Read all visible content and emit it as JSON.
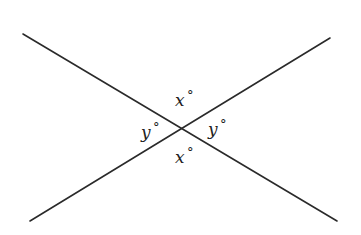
{
  "diagram": {
    "type": "intersecting-lines",
    "lines": [
      {
        "id": "line-1",
        "from": [
          23,
          34
        ],
        "to": [
          337,
          221
        ]
      },
      {
        "id": "line-2",
        "from": [
          30,
          221
        ],
        "to": [
          330,
          38
        ]
      }
    ],
    "intersection": [
      180,
      127
    ],
    "labels": [
      {
        "id": "angle-top",
        "variable": "x",
        "degree": "°",
        "position": "top",
        "x": 175,
        "y": 106
      },
      {
        "id": "angle-left",
        "variable": "y",
        "degree": "°",
        "position": "left",
        "x": 141,
        "y": 138
      },
      {
        "id": "angle-right",
        "variable": "y",
        "degree": "°",
        "position": "right",
        "x": 208,
        "y": 135
      },
      {
        "id": "angle-bottom",
        "variable": "x",
        "degree": "°",
        "position": "bottom",
        "x": 175,
        "y": 163
      }
    ],
    "colors": {
      "stroke": "#2a2a2a",
      "text": "#222222",
      "background": "#ffffff"
    }
  }
}
